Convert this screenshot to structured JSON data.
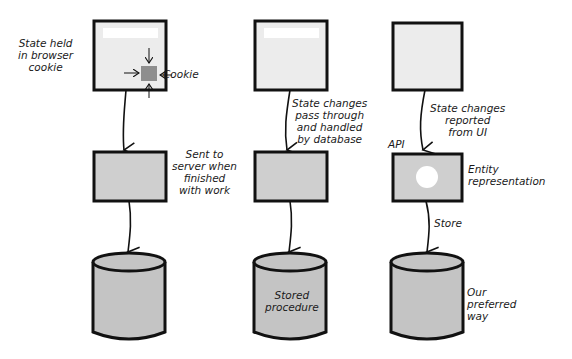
{
  "columns": [
    {
      "id": "cookie",
      "browser_label": "State held\nin browser\ncookie",
      "cookie_label": "Cookie",
      "transfer_label": "Sent to\nserver when\nfinished\nwith work",
      "db_label": ""
    },
    {
      "id": "database",
      "transfer_label": "State changes\npass through\nand handled\nby database",
      "db_label": "Stored\nprocedure"
    },
    {
      "id": "api",
      "transfer_label": "State changes\nreported\nfrom UI",
      "api_label": "API",
      "entity_label": "Entity\nrepresentation",
      "store_label": "Store",
      "db_label": "Our\npreferred\nway"
    }
  ],
  "colors": {
    "stroke": "#111111",
    "browser_fill": "#ececec",
    "server_fill": "#cfcfcf",
    "db_fill": "#c4c4c4",
    "cookie_fill": "#8e8e8e"
  }
}
